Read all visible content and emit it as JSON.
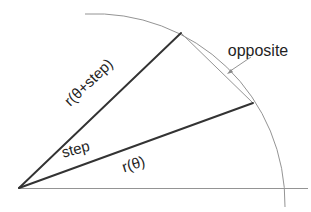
{
  "diagram": {
    "type": "geometry-illustration",
    "labels": {
      "r_theta_plus_step": "r(θ+step)",
      "step": "step",
      "r_theta": "r(θ)",
      "opposite": "opposite"
    },
    "colors": {
      "primary_line": "#333333",
      "secondary_line": "#949494",
      "text": "#1f1f1f",
      "background": "#ffffff"
    }
  }
}
